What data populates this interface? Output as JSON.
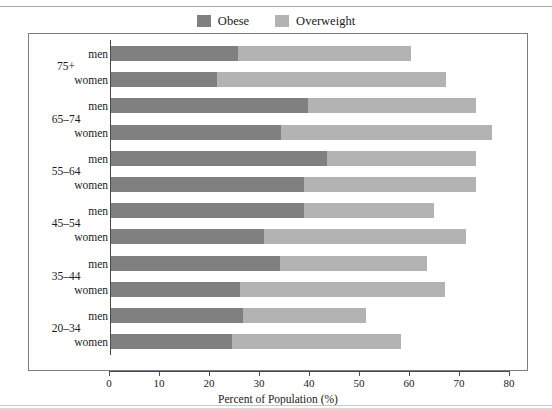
{
  "figure": {
    "top_caption": "",
    "legend": [
      {
        "label": "Obese",
        "color": "#808080",
        "icon": "legend-swatch-icon"
      },
      {
        "label": "Overweight",
        "color": "#b3b3b3",
        "icon": "legend-swatch-icon"
      }
    ]
  },
  "chart_data": {
    "type": "bar",
    "orientation": "horizontal",
    "stacked": true,
    "title": "",
    "subtitle": "",
    "xlabel": "Percent of Population (%)",
    "ylabel": "Age in Years",
    "xlim": [
      0,
      80
    ],
    "xticks": [
      0,
      10,
      20,
      30,
      40,
      50,
      60,
      70,
      80
    ],
    "xtick_labels": [
      "0",
      "10",
      "20",
      "30",
      "40",
      "50",
      "60",
      "70",
      "80"
    ],
    "grid": false,
    "legend_position": "top-center",
    "groups": [
      "75+",
      "65–74",
      "55–64",
      "45–54",
      "35–44",
      "20–34"
    ],
    "categories": [
      "75+ men",
      "75+ women",
      "65–74 men",
      "65–74 women",
      "55–64 men",
      "55–64 women",
      "45–54 men",
      "45–54 women",
      "35–44 men",
      "35–44 women",
      "20–34 men",
      "20–34 women"
    ],
    "series": [
      {
        "name": "Obese",
        "color": "#808080",
        "values": [
          25.4,
          21.2,
          39.4,
          34.0,
          43.2,
          38.6,
          38.6,
          30.6,
          33.8,
          25.8,
          26.4,
          24.2
        ]
      },
      {
        "name": "Overweight",
        "color": "#b3b3b3",
        "values": [
          34.6,
          45.8,
          33.6,
          42.2,
          29.8,
          34.4,
          26.0,
          40.4,
          29.4,
          41.0,
          24.6,
          33.8
        ]
      }
    ],
    "totals": [
      60.0,
      67.0,
      73.0,
      76.2,
      73.0,
      73.0,
      64.6,
      71.0,
      63.2,
      66.8,
      51.0,
      58.0
    ],
    "rows": [
      {
        "group": "75+",
        "sex": "men",
        "obese": 25.4,
        "overweight": 34.6,
        "total": 60.0
      },
      {
        "group": "75+",
        "sex": "women",
        "obese": 21.2,
        "overweight": 45.8,
        "total": 67.0
      },
      {
        "group": "65–74",
        "sex": "men",
        "obese": 39.4,
        "overweight": 33.6,
        "total": 73.0
      },
      {
        "group": "65–74",
        "sex": "women",
        "obese": 34.0,
        "overweight": 42.2,
        "total": 76.2
      },
      {
        "group": "55–64",
        "sex": "men",
        "obese": 43.2,
        "overweight": 29.8,
        "total": 73.0
      },
      {
        "group": "55–64",
        "sex": "women",
        "obese": 38.6,
        "overweight": 34.4,
        "total": 73.0
      },
      {
        "group": "45–54",
        "sex": "men",
        "obese": 38.6,
        "overweight": 26.0,
        "total": 64.6
      },
      {
        "group": "45–54",
        "sex": "women",
        "obese": 30.6,
        "overweight": 40.4,
        "total": 71.0
      },
      {
        "group": "35–44",
        "sex": "men",
        "obese": 33.8,
        "overweight": 29.4,
        "total": 63.2
      },
      {
        "group": "35–44",
        "sex": "women",
        "obese": 25.8,
        "overweight": 41.0,
        "total": 66.8
      },
      {
        "group": "20–34",
        "sex": "men",
        "obese": 26.4,
        "overweight": 24.6,
        "total": 51.0
      },
      {
        "group": "20–34",
        "sex": "women",
        "obese": 24.2,
        "overweight": 33.8,
        "total": 58.0
      }
    ]
  },
  "colors": {
    "obese": "#808080",
    "overweight": "#b3b3b3",
    "axis": "#4a4a4a",
    "frame": "#7d7d7d",
    "text": "#1a1a1a",
    "background": "#ffffff"
  }
}
